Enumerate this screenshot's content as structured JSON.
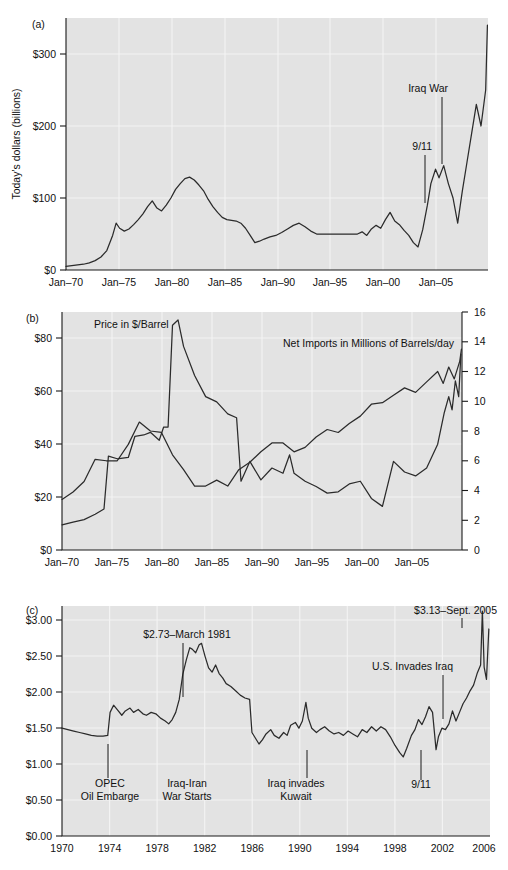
{
  "figure": {
    "panels": [
      "(a)",
      "(b)",
      "(c)"
    ]
  },
  "panel_a": {
    "letter": "(a)",
    "ylabel": "Today's dollars (billions)",
    "yticks": [
      "$0",
      "$100",
      "$200",
      "$300"
    ],
    "xticks": [
      "Jan–70",
      "Jan–75",
      "Jan–80",
      "Jan–85",
      "Jan–90",
      "Jan–95",
      "Jan–00",
      "Jan–05"
    ],
    "annotations": [
      {
        "text": "Iraq War"
      },
      {
        "text": "9/11"
      }
    ]
  },
  "panel_b": {
    "letter": "(b)",
    "yticks_left": [
      "$0",
      "$20",
      "$40",
      "$60",
      "$80"
    ],
    "yticks_right": [
      "0",
      "2",
      "4",
      "6",
      "8",
      "10",
      "12",
      "14",
      "16"
    ],
    "xticks": [
      "Jan–70",
      "Jan–75",
      "Jan–80",
      "Jan–85",
      "Jan–90",
      "Jan–95",
      "Jan–00",
      "Jan–05"
    ],
    "series_labels": [
      {
        "text": "Price in $/Barrel"
      },
      {
        "text": "Net Imports in Millions of Barrels/day"
      }
    ]
  },
  "panel_c": {
    "letter": "(c)",
    "yticks": [
      "$0.00",
      "$0.50",
      "$1.00",
      "$1.50",
      "$2.00",
      "$2.50",
      "$3.00"
    ],
    "xticks": [
      "1970",
      "1974",
      "1978",
      "1982",
      "1986",
      "1990",
      "1994",
      "1998",
      "2002",
      "2006"
    ],
    "annotations": [
      {
        "text": "$2.73–March 1981"
      },
      {
        "text": "$3.13–Sept. 2005"
      },
      {
        "text": "U.S. Invades Iraq"
      },
      {
        "text": "OPEC"
      },
      {
        "text": "Oil Embarge"
      },
      {
        "text": "Iraq-Iran"
      },
      {
        "text": "War Starts"
      },
      {
        "text": "Iraq invades"
      },
      {
        "text": "Kuwait"
      },
      {
        "text": "9/11"
      }
    ]
  },
  "colors": {
    "plot_background": "#e3e3e3",
    "gridline": "#f4f4f4",
    "series_line": "#2b2b2b",
    "axis": "#1a1a1a",
    "text": "#111111",
    "page_background": "#ffffff"
  },
  "chart_data": [
    {
      "id": "panel_a",
      "type": "line",
      "title": "",
      "xlabel": "",
      "ylabel": "Today's dollars (billions)",
      "xlim": [
        1970,
        2006.2
      ],
      "ylim": [
        0,
        350
      ],
      "yticks": [
        0,
        100,
        200,
        300
      ],
      "ytick_labels": [
        "$0",
        "$100",
        "$200",
        "$300"
      ],
      "xticks": [
        1970,
        1975,
        1980,
        1985,
        1990,
        1995,
        2000,
        2005
      ],
      "xtick_labels": [
        "Jan–70",
        "Jan–75",
        "Jan–80",
        "Jan–85",
        "Jan–90",
        "Jan–95",
        "Jan–00",
        "Jan–05"
      ],
      "grid": true,
      "legend": "none",
      "series": [
        {
          "name": "Monthly U.S. petroleum import bill (today's dollars, billions)",
          "x": [
            1970.0,
            1970.5,
            1971.0,
            1971.5,
            1972.0,
            1972.5,
            1973.0,
            1973.5,
            1974.0,
            1974.3,
            1974.6,
            1975.0,
            1975.4,
            1975.8,
            1976.2,
            1976.6,
            1977.0,
            1977.4,
            1977.8,
            1978.2,
            1978.6,
            1979.0,
            1979.4,
            1979.8,
            1980.2,
            1980.6,
            1981.0,
            1981.4,
            1981.8,
            1982.2,
            1982.6,
            1983.0,
            1983.4,
            1983.8,
            1984.2,
            1984.6,
            1985.0,
            1985.4,
            1985.8,
            1986.2,
            1986.6,
            1987.0,
            1987.5,
            1988.0,
            1988.5,
            1989.0,
            1989.5,
            1990.0,
            1990.5,
            1991.0,
            1991.5,
            1992.0,
            1992.5,
            1993.0,
            1993.5,
            1994.0,
            1994.5,
            1995.0,
            1995.4,
            1995.8,
            1996.2,
            1996.6,
            1997.0,
            1997.4,
            1997.8,
            1998.2,
            1998.6,
            1999.0,
            1999.4,
            1999.8,
            2000.2,
            2000.6,
            2001.0,
            2001.3,
            2001.7,
            2002.0,
            2002.4,
            2002.8,
            2003.2,
            2003.6,
            2004.0,
            2004.4,
            2004.8,
            2005.2,
            2005.6,
            2006.0,
            2006.15
          ],
          "y": [
            5,
            6,
            7,
            8,
            10,
            13,
            18,
            27,
            48,
            65,
            58,
            54,
            57,
            63,
            70,
            78,
            88,
            96,
            86,
            82,
            90,
            100,
            112,
            120,
            127,
            129,
            125,
            118,
            110,
            98,
            88,
            80,
            73,
            70,
            69,
            68,
            65,
            58,
            48,
            38,
            40,
            43,
            46,
            48,
            52,
            57,
            62,
            65,
            60,
            54,
            50,
            50,
            50,
            50,
            50,
            50,
            50,
            50,
            53,
            48,
            57,
            62,
            58,
            70,
            80,
            68,
            63,
            55,
            48,
            38,
            32,
            56,
            90,
            120,
            140,
            128,
            145,
            120,
            100,
            65,
            110,
            150,
            190,
            230,
            200,
            250,
            340,
            290
          ],
          "units": "billions of today's dollars"
        }
      ],
      "annotations": [
        {
          "text": "Iraq War",
          "x": 2003.3,
          "y_text": 250,
          "y_point": 148
        },
        {
          "text": "9/11",
          "x": 2001.7,
          "y_text": 168,
          "y_point": 98
        }
      ]
    },
    {
      "id": "panel_b",
      "type": "line",
      "title": "",
      "xlabel": "",
      "ylabel_left": "Price in $/Barrel",
      "ylabel_right": "Net Imports in Millions of Barrels/day",
      "xlim": [
        1970,
        2006.2
      ],
      "ylim_left": [
        0,
        90
      ],
      "ylim_right": [
        0,
        16
      ],
      "yticks_left": [
        0,
        20,
        40,
        60,
        80
      ],
      "ytick_labels_left": [
        "$0",
        "$20",
        "$40",
        "$60",
        "$80"
      ],
      "yticks_right": [
        0,
        2,
        4,
        6,
        8,
        10,
        12,
        14,
        16
      ],
      "ytick_labels_right": [
        "0",
        "2",
        "4",
        "6",
        "8",
        "10",
        "12",
        "14",
        "16"
      ],
      "xticks": [
        1970,
        1975,
        1980,
        1985,
        1990,
        1995,
        2000,
        2005
      ],
      "xtick_labels": [
        "Jan–70",
        "Jan–75",
        "Jan–80",
        "Jan–85",
        "Jan–90",
        "Jan–95",
        "Jan–00",
        "Jan–05"
      ],
      "grid": true,
      "legend": "inline-labels",
      "series": [
        {
          "name": "Price in $/Barrel",
          "axis": "left",
          "x": [
            1970,
            1971,
            1972,
            1973,
            1973.8,
            1974.2,
            1975,
            1976,
            1976.6,
            1977.4,
            1978,
            1978.8,
            1979.2,
            1979.6,
            1980.0,
            1980.5,
            1981,
            1982,
            1983,
            1984,
            1985,
            1985.8,
            1986.2,
            1987,
            1988,
            1989,
            1990,
            1990.6,
            1991,
            1992,
            1993,
            1994,
            1995,
            1996,
            1997,
            1998,
            1999,
            2000,
            2001,
            2002,
            2003,
            2004,
            2004.6,
            2005,
            2005.3,
            2005.6,
            2005.9,
            2006.1
          ],
          "y": [
            9.5,
            10.5,
            11.5,
            13.5,
            15.5,
            35.5,
            34.5,
            35,
            43,
            43.5,
            44.5,
            41.5,
            46.5,
            46.5,
            85,
            87,
            77,
            66,
            58,
            56,
            51.5,
            50,
            26,
            33.5,
            26.5,
            31,
            29,
            36,
            29,
            26,
            24,
            21.5,
            22,
            25,
            26,
            19.5,
            16.5,
            33.5,
            29.5,
            28,
            31,
            40,
            52,
            58,
            53,
            64,
            58,
            74
          ],
          "units": "$/barrel (today's dollars)"
        },
        {
          "name": "Net Imports in Millions of Barrels/day",
          "axis": "right",
          "x": [
            1970,
            1971,
            1972,
            1973,
            1974,
            1975,
            1976,
            1977,
            1978,
            1979,
            1980,
            1981,
            1982,
            1983,
            1984,
            1985,
            1986,
            1987,
            1988,
            1989,
            1990,
            1991,
            1992,
            1993,
            1994,
            1995,
            1996,
            1997,
            1998,
            1999,
            2000,
            2001,
            2002,
            2003,
            2004,
            2004.5,
            2005,
            2005.5,
            2006,
            2006.15
          ],
          "y": [
            3.4,
            3.9,
            4.6,
            6.1,
            6.0,
            6.0,
            7.1,
            8.6,
            8.0,
            7.9,
            6.4,
            5.4,
            4.3,
            4.3,
            4.7,
            4.3,
            5.4,
            5.9,
            6.6,
            7.2,
            7.2,
            6.6,
            6.9,
            7.6,
            8.1,
            7.9,
            8.5,
            9.0,
            9.8,
            9.9,
            10.4,
            10.9,
            10.6,
            11.3,
            12.0,
            11.2,
            12.3,
            11.5,
            12.7,
            13.5
          ],
          "units": "million barrels/day"
        }
      ],
      "annotations": [
        {
          "text": "Price in $/Barrel",
          "x": 1974.5,
          "y": 86
        },
        {
          "text": "Net Imports in Millions of Barrels/day",
          "x": 1994.0,
          "y": 73
        }
      ]
    },
    {
      "id": "panel_c",
      "type": "line",
      "title": "",
      "xlabel": "",
      "ylabel": "Gasoline price ($/gallon)",
      "xlim": [
        1970,
        2006.5
      ],
      "ylim": [
        0,
        3.2
      ],
      "yticks": [
        0,
        0.5,
        1.0,
        1.5,
        2.0,
        2.5,
        3.0
      ],
      "ytick_labels": [
        "$0.00",
        "$0.50",
        "$1.00",
        "$1.50",
        "$2.00",
        "$2.50",
        "$3.00"
      ],
      "xticks": [
        1970,
        1974,
        1978,
        1982,
        1986,
        1990,
        1994,
        1998,
        2002,
        2006
      ],
      "xtick_labels": [
        "1970",
        "1974",
        "1978",
        "1982",
        "1986",
        "1990",
        "1994",
        "1998",
        "2002",
        "2006"
      ],
      "grid": true,
      "legend": "none",
      "series": [
        {
          "name": "Real retail gasoline price ($/gallon, today's dollars)",
          "x": [
            1970.0,
            1970.5,
            1971.0,
            1971.5,
            1972.0,
            1972.5,
            1973.0,
            1973.5,
            1973.9,
            1974.1,
            1974.4,
            1974.8,
            1975.1,
            1975.4,
            1975.8,
            1976.1,
            1976.5,
            1976.9,
            1977.2,
            1977.6,
            1978.0,
            1978.4,
            1978.8,
            1979.1,
            1979.4,
            1979.7,
            1980.0,
            1980.3,
            1980.6,
            1980.9,
            1981.1,
            1981.4,
            1981.7,
            1981.9,
            1982.2,
            1982.5,
            1982.8,
            1983.1,
            1983.4,
            1983.7,
            1984.0,
            1984.4,
            1984.8,
            1985.2,
            1985.6,
            1986.0,
            1986.2,
            1986.5,
            1986.8,
            1987.1,
            1987.4,
            1987.8,
            1988.1,
            1988.5,
            1988.9,
            1989.2,
            1989.5,
            1989.9,
            1990.2,
            1990.5,
            1990.8,
            1991.0,
            1991.3,
            1991.7,
            1992.0,
            1992.4,
            1992.8,
            1993.2,
            1993.6,
            1994.0,
            1994.4,
            1994.8,
            1995.2,
            1995.6,
            1996.0,
            1996.4,
            1996.8,
            1997.2,
            1997.6,
            1998.0,
            1998.4,
            1998.8,
            1999.1,
            1999.4,
            1999.8,
            2000.1,
            2000.4,
            2000.7,
            2001.0,
            2001.3,
            2001.6,
            2001.9,
            2002.1,
            2002.4,
            2002.7,
            2003.0,
            2003.3,
            2003.6,
            2003.9,
            2004.2,
            2004.5,
            2004.8,
            2005.1,
            2005.4,
            2005.7,
            2005.85,
            2006.0,
            2006.2,
            2006.4
          ],
          "y": [
            1.5,
            1.48,
            1.46,
            1.44,
            1.42,
            1.4,
            1.39,
            1.39,
            1.4,
            1.72,
            1.82,
            1.74,
            1.68,
            1.74,
            1.78,
            1.72,
            1.76,
            1.7,
            1.68,
            1.72,
            1.7,
            1.64,
            1.6,
            1.56,
            1.62,
            1.72,
            1.9,
            2.25,
            2.45,
            2.62,
            2.6,
            2.55,
            2.66,
            2.68,
            2.5,
            2.34,
            2.28,
            2.38,
            2.26,
            2.2,
            2.12,
            2.08,
            2.02,
            1.96,
            1.92,
            1.9,
            1.44,
            1.36,
            1.28,
            1.34,
            1.42,
            1.48,
            1.4,
            1.36,
            1.44,
            1.4,
            1.54,
            1.58,
            1.5,
            1.6,
            1.86,
            1.64,
            1.5,
            1.44,
            1.48,
            1.52,
            1.46,
            1.42,
            1.44,
            1.4,
            1.46,
            1.42,
            1.38,
            1.48,
            1.44,
            1.52,
            1.46,
            1.52,
            1.48,
            1.38,
            1.26,
            1.16,
            1.1,
            1.22,
            1.4,
            1.48,
            1.62,
            1.55,
            1.66,
            1.8,
            1.72,
            1.2,
            1.38,
            1.5,
            1.48,
            1.56,
            1.74,
            1.6,
            1.72,
            1.84,
            1.92,
            2.02,
            2.1,
            2.26,
            2.38,
            3.13,
            2.35,
            2.18,
            2.88,
            2.5
          ],
          "units": "$/gallon"
        }
      ],
      "annotations": [
        {
          "text": "$2.73–March 1981",
          "x": 1981.0,
          "y_text": 2.78,
          "y_point": 2.5
        },
        {
          "text": "$3.13–Sept. 2005",
          "x": 2005.7,
          "y_text": 3.13,
          "y_point": 3.08
        },
        {
          "text": "U.S. Invades Iraq",
          "x": 2003.2,
          "y_text": 2.3,
          "y_point": 1.62
        },
        {
          "text": "OPEC Oil Embarge",
          "x": 1973.9,
          "y_text": 0.82,
          "y_point": 1.22
        },
        {
          "text": "Iraq-Iran War Starts",
          "x": 1980.9,
          "y_text": 0.82,
          "y_point": 2.48
        },
        {
          "text": "Iraq invades Kuwait",
          "x": 1990.6,
          "y_text": 0.82,
          "y_point": 1.14
        },
        {
          "text": "9/11",
          "x": 2001.7,
          "y_text": 0.84,
          "y_point": 1.18
        }
      ]
    }
  ]
}
